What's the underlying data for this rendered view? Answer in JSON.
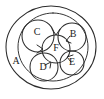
{
  "diagram": {
    "style": "hand-drawn",
    "stroke_color": "#2b2b2b",
    "background_color": "#ffffff",
    "sets": [
      {
        "id": "A",
        "label": "A",
        "label_x": 16,
        "label_y": 62,
        "cx": 51,
        "cy": 47,
        "rx": 45,
        "ry": 41,
        "role": "outermost-set"
      },
      {
        "id": "universe-inner",
        "label": "",
        "label_x": 0,
        "label_y": 0,
        "cx": 53,
        "cy": 47,
        "rx": 35,
        "ry": 34,
        "role": "inner-boundary"
      },
      {
        "id": "C",
        "label": "C",
        "label_x": 37,
        "label_y": 33,
        "cx": 38,
        "cy": 36,
        "rx": 16,
        "ry": 16,
        "role": "member-set"
      },
      {
        "id": "B",
        "label": "B",
        "label_x": 73,
        "label_y": 35,
        "cx": 72,
        "cy": 37,
        "rx": 14,
        "ry": 14,
        "role": "member-set"
      },
      {
        "id": "D",
        "label": "D",
        "label_x": 43,
        "label_y": 68,
        "cx": 44,
        "cy": 67,
        "rx": 14,
        "ry": 14,
        "role": "member-set"
      },
      {
        "id": "E",
        "label": "E",
        "label_x": 72,
        "label_y": 63,
        "cx": 72,
        "cy": 63,
        "rx": 12,
        "ry": 12,
        "role": "member-set"
      },
      {
        "id": "F",
        "label": "F",
        "label_x": 56,
        "label_y": 49,
        "cx": 56,
        "cy": 49,
        "rx": 14,
        "ry": 14,
        "role": "central-set"
      }
    ],
    "arrows": [
      {
        "id": "arrow-into-f-top",
        "target": "F",
        "from": "C-B",
        "x": 56,
        "y": 34,
        "angle": 90
      },
      {
        "id": "arrow-into-f-left",
        "target": "F",
        "from": "C",
        "x": 43,
        "y": 49,
        "angle": 0
      },
      {
        "id": "arrow-into-f-bottom",
        "target": "F",
        "from": "D",
        "x": 51,
        "y": 62,
        "angle": 250
      },
      {
        "id": "arrow-into-f-right",
        "target": "F",
        "from": "E",
        "x": 68,
        "y": 57,
        "angle": 200
      },
      {
        "id": "arrow-into-f-upper-right",
        "target": "F",
        "from": "B",
        "x": 66,
        "y": 40,
        "angle": 150
      }
    ]
  }
}
